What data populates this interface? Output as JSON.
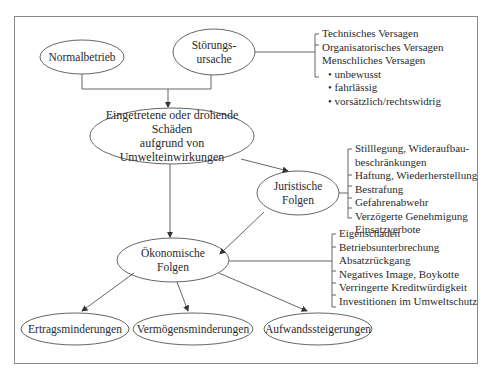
{
  "nodes": {
    "normalbetrieb": "Normalbetrieb",
    "stoerungsursache_1": "Störungs-",
    "stoerungsursache_2": "ursache",
    "schaeden_1": "Eingetretene oder drohende Schäden",
    "schaeden_2": "aufgrund von Umwelteinwirkungen",
    "juristisch_1": "Juristische",
    "juristisch_2": "Folgen",
    "oekonomisch_1": "Ökonomische",
    "oekonomisch_2": "Folgen",
    "ertrag": "Ertragsminderungen",
    "vermoegen": "Vermögensminderungen",
    "aufwand": "Aufwandssteigerungen"
  },
  "lists": {
    "stoerungsursachen": [
      "Technisches Versagen",
      "Organisatorisches Versagen",
      "Menschliches Versagen"
    ],
    "menschliches_versagen": [
      "• unbewusst",
      "• fahrlässig",
      "• vorsätzlich/rechtswidrig"
    ],
    "juristische_folgen": [
      "Stilllegung, Wideraufbau-",
      "beschränkungen",
      "Haftung, Wiederherstellung",
      "Bestrafung",
      "Gefahrenabwehr",
      "Verzögerte Genehmigung",
      "Einsatzverbote"
    ],
    "oekonomische_folgen": [
      "Eigenschaden",
      "Betriebsunterbrechung",
      "Absatzrückgang",
      "Negatives Image, Boykotte",
      "Verringerte Kreditwürdigkeit",
      "Investitionen im Umweltschutz"
    ]
  },
  "colors": {
    "line": "#555555",
    "frame": "#8a8a8a",
    "text": "#2a2a2a"
  }
}
